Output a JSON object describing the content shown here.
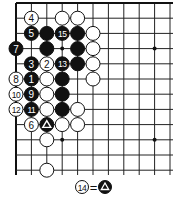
{
  "diagram": {
    "type": "go-board-fragment",
    "corner": "top-left",
    "grid": {
      "origin_x": 16,
      "origin_y": 3,
      "spacing_x": 15.4,
      "spacing_y": 15.2,
      "columns": 11,
      "rows": 12,
      "line_extent_x": 173,
      "line_extent_y": 175,
      "top_edge": true,
      "left_edge": true
    },
    "star_points": [
      {
        "col": 3,
        "row": 3
      },
      {
        "col": 9,
        "row": 3
      },
      {
        "col": 3,
        "row": 9
      },
      {
        "col": 9,
        "row": 9
      }
    ],
    "stones": [
      {
        "col": 1,
        "row": 1,
        "color": "white",
        "label": "4"
      },
      {
        "col": 3,
        "row": 1,
        "color": "white",
        "label": ""
      },
      {
        "col": 4,
        "row": 1,
        "color": "white",
        "label": ""
      },
      {
        "col": 1,
        "row": 2,
        "color": "black",
        "label": "5"
      },
      {
        "col": 2,
        "row": 2,
        "color": "black",
        "label": ""
      },
      {
        "col": 3,
        "row": 2,
        "color": "black",
        "label": "15"
      },
      {
        "col": 4,
        "row": 2,
        "color": "black",
        "label": ""
      },
      {
        "col": 5,
        "row": 2,
        "color": "white",
        "label": ""
      },
      {
        "col": 0,
        "row": 3,
        "color": "black",
        "label": "7"
      },
      {
        "col": 2,
        "row": 3,
        "color": "black",
        "label": ""
      },
      {
        "col": 4,
        "row": 3,
        "color": "black",
        "label": ""
      },
      {
        "col": 5,
        "row": 3,
        "color": "white",
        "label": ""
      },
      {
        "col": 1,
        "row": 4,
        "color": "black",
        "label": "3"
      },
      {
        "col": 2,
        "row": 4,
        "color": "white",
        "label": "2"
      },
      {
        "col": 3,
        "row": 4,
        "color": "black",
        "label": "13"
      },
      {
        "col": 4,
        "row": 4,
        "color": "black",
        "label": ""
      },
      {
        "col": 5,
        "row": 4,
        "color": "white",
        "label": ""
      },
      {
        "col": 0,
        "row": 5,
        "color": "white",
        "label": "8"
      },
      {
        "col": 1,
        "row": 5,
        "color": "black",
        "label": "1"
      },
      {
        "col": 2,
        "row": 5,
        "color": "white",
        "label": ""
      },
      {
        "col": 3,
        "row": 5,
        "color": "black",
        "label": ""
      },
      {
        "col": 5,
        "row": 5,
        "color": "white",
        "label": ""
      },
      {
        "col": 0,
        "row": 6,
        "color": "white",
        "label": "10"
      },
      {
        "col": 1,
        "row": 6,
        "color": "black",
        "label": "9"
      },
      {
        "col": 2,
        "row": 6,
        "color": "white",
        "label": ""
      },
      {
        "col": 3,
        "row": 6,
        "color": "black",
        "label": ""
      },
      {
        "col": 0,
        "row": 7,
        "color": "white",
        "label": "12"
      },
      {
        "col": 1,
        "row": 7,
        "color": "black",
        "label": "11"
      },
      {
        "col": 2,
        "row": 7,
        "color": "white",
        "label": ""
      },
      {
        "col": 3,
        "row": 7,
        "color": "black",
        "label": ""
      },
      {
        "col": 4,
        "row": 7,
        "color": "white",
        "label": ""
      },
      {
        "col": 1,
        "row": 8,
        "color": "white",
        "label": "6"
      },
      {
        "col": 2,
        "row": 8,
        "color": "black",
        "label": "",
        "marker": "triangle"
      },
      {
        "col": 3,
        "row": 8,
        "color": "white",
        "label": ""
      },
      {
        "col": 4,
        "row": 8,
        "color": "white",
        "label": ""
      },
      {
        "col": 2,
        "row": 9,
        "color": "white",
        "label": ""
      },
      {
        "col": 2,
        "row": 11,
        "color": "white",
        "label": ""
      }
    ],
    "caption": {
      "move_label": "14",
      "equals": "=",
      "target_marker": "triangle",
      "target_color": "black",
      "text": "⑭ = ▲"
    }
  }
}
